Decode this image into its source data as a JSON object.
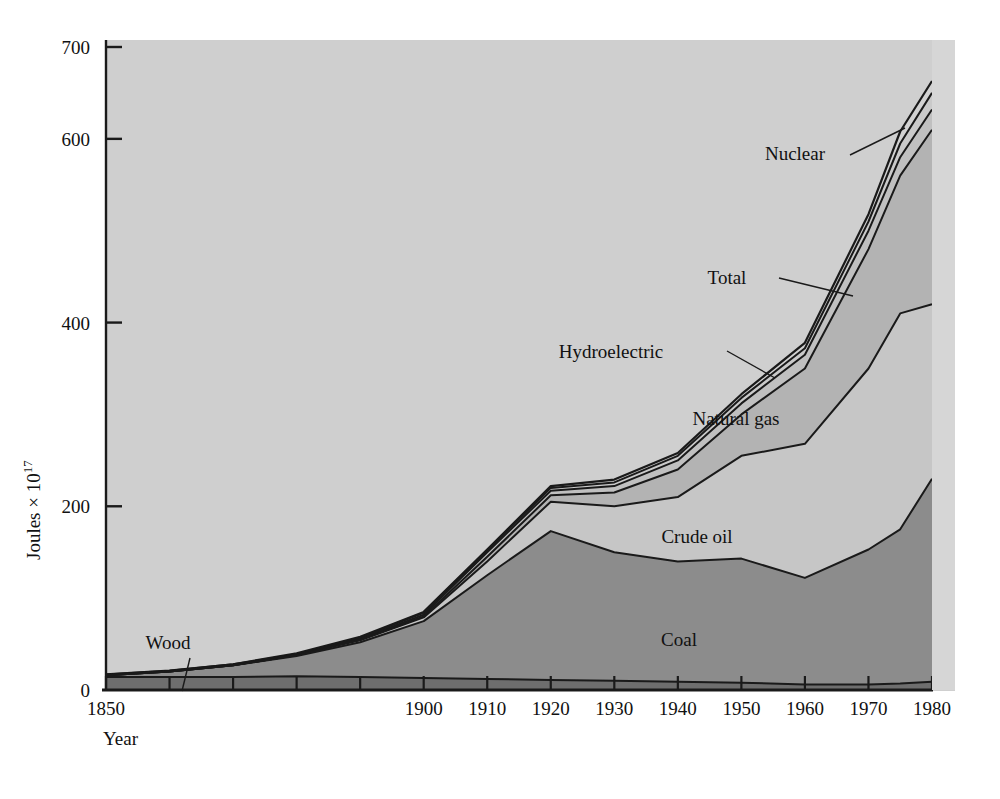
{
  "chart_data": {
    "type": "area",
    "stacked": true,
    "title": "",
    "xlabel": "Year",
    "ylabel": "Joules × 10",
    "ylabel_exponent": "17",
    "xlim": [
      1850,
      1980
    ],
    "ylim": [
      0,
      700
    ],
    "grid": false,
    "legend_position": "inline-annotations",
    "x_ticks_labeled": [
      "1850",
      "1900",
      "1910",
      "1920",
      "1930",
      "1940",
      "1950",
      "1960",
      "1970",
      "1980"
    ],
    "x_ticks_all": [
      1850,
      1860,
      1870,
      1880,
      1890,
      1900,
      1910,
      1920,
      1930,
      1940,
      1950,
      1960,
      1970,
      1980
    ],
    "y_ticks": [
      "0",
      "200",
      "400",
      "600",
      "700"
    ],
    "y_tick_values": [
      0,
      200,
      400,
      600,
      700
    ],
    "x": [
      1850,
      1860,
      1870,
      1880,
      1890,
      1900,
      1910,
      1920,
      1930,
      1940,
      1950,
      1960,
      1970,
      1975,
      1980
    ],
    "series": [
      {
        "name": "Wood",
        "label": "Wood",
        "color": "#6e6e6e",
        "cumulative": [
          14,
          14,
          14,
          15,
          14,
          13,
          12,
          11,
          10,
          9,
          8,
          6,
          6,
          7,
          9
        ]
      },
      {
        "name": "Coal",
        "label": "Coal",
        "color": "#8c8c8c",
        "cumulative": [
          16,
          20,
          27,
          37,
          52,
          75,
          125,
          173,
          150,
          140,
          143,
          122,
          153,
          175,
          230
        ]
      },
      {
        "name": "Crude oil",
        "label": "Crude oil",
        "color": "#c6c6c6",
        "cumulative": [
          16,
          20,
          27,
          38,
          54,
          79,
          140,
          205,
          200,
          210,
          255,
          268,
          350,
          410,
          420
        ]
      },
      {
        "name": "Natural gas",
        "label": "Natural gas",
        "color": "#b3b3b3",
        "cumulative": [
          16,
          20,
          27,
          38,
          55,
          80,
          145,
          212,
          215,
          240,
          300,
          350,
          480,
          560,
          610
        ]
      },
      {
        "name": "Hydroelectric",
        "label": "Hydroelectric",
        "color": "#c0c0c0",
        "cumulative": [
          16,
          20,
          27,
          38,
          56,
          82,
          150,
          217,
          222,
          250,
          312,
          365,
          500,
          580,
          632
        ]
      },
      {
        "name": "Nuclear",
        "label": "Nuclear",
        "color": "#cacaca",
        "cumulative": [
          17,
          21,
          28,
          39,
          57,
          84,
          152,
          220,
          226,
          255,
          318,
          372,
          510,
          595,
          650
        ]
      },
      {
        "name": "Total",
        "label": "Total",
        "color": "#d2d2d2",
        "cumulative": [
          17,
          21,
          28,
          40,
          58,
          85,
          153,
          222,
          229,
          258,
          322,
          378,
          518,
          608,
          663
        ]
      }
    ],
    "annotations": [
      {
        "id": "nuclear",
        "text": "Nuclear",
        "x": 795,
        "y": 160
      },
      {
        "id": "total",
        "text": "Total",
        "x": 727,
        "y": 284
      },
      {
        "id": "hydroelectric",
        "text": "Hydroelectric",
        "x": 611,
        "y": 358
      },
      {
        "id": "natural-gas",
        "text": "Natural gas",
        "x": 736,
        "y": 425
      },
      {
        "id": "crude-oil",
        "text": "Crude oil",
        "x": 697,
        "y": 543
      },
      {
        "id": "coal",
        "text": "Coal",
        "x": 679,
        "y": 646
      },
      {
        "id": "wood",
        "text": "Wood",
        "x": 168,
        "y": 649
      }
    ],
    "colors": {
      "plot_background": "#cfcfcf",
      "page_background": "#ffffff",
      "line": "#1a1a1a",
      "text": "#111111"
    }
  }
}
